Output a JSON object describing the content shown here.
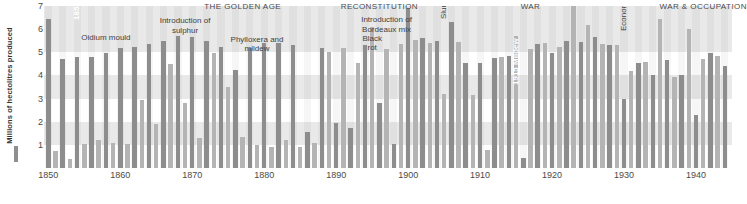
{
  "axes": {
    "y_title": "Millions of hectolitres produced",
    "y_ticks": [
      "1",
      "2",
      "3",
      "4",
      "5",
      "6",
      "7"
    ],
    "x_ticks": [
      "1850",
      "1860",
      "1870",
      "1880",
      "1890",
      "1900",
      "1910",
      "1920",
      "1930",
      "1940"
    ]
  },
  "eras": [
    {
      "label": "THE GOLDEN AGE",
      "year": 1877
    },
    {
      "label": "RECONSTITUTION",
      "year": 1896
    },
    {
      "label": "WAR",
      "year": 1917
    },
    {
      "label": "WAR & OCCUPATION",
      "year": 1941
    }
  ],
  "notes": [
    {
      "label": "Introduction of\nsulphur",
      "year": 1869,
      "value": 6.55
    },
    {
      "label": "Oidium mould",
      "year": 1858,
      "value": 5.85
    },
    {
      "label": "Phylloxera and\nmildew",
      "year": 1879,
      "value": 5.75
    },
    {
      "label": "Introduction of\nBordeaux mix",
      "year": 1897,
      "value": 6.6
    },
    {
      "label": "Black\nrot",
      "year": 1895,
      "value": 5.8
    }
  ],
  "vertical_notes": [
    {
      "label": "1855 Classification of the Médoc",
      "year": 1855,
      "value": 6.4,
      "style": "white"
    },
    {
      "label": "Slump",
      "year": 1906,
      "value": 6.45,
      "style": "dark"
    },
    {
      "label": "1915 Mildew",
      "year": 1916,
      "value": 3.6,
      "style": "white"
    },
    {
      "label": "Economic crisis",
      "year": 1931,
      "value": 5.9,
      "style": "dark"
    }
  ],
  "colors": {
    "bar_dark": "#8d8d8d",
    "bar_light": "#b4b4b4",
    "band": "#e9e9e9",
    "text": "#4a4a4a",
    "background": "#ffffff"
  },
  "chart_data": {
    "type": "bar",
    "title": "",
    "xlabel": "",
    "ylabel": "Millions of hectolitres produced",
    "xlim": [
      1849,
      1945
    ],
    "ylim": [
      0,
      7
    ],
    "grid": "horizontal-bands",
    "legend": "none",
    "x": [
      1850,
      1851,
      1852,
      1853,
      1854,
      1855,
      1856,
      1857,
      1858,
      1859,
      1860,
      1861,
      1862,
      1863,
      1864,
      1865,
      1866,
      1867,
      1868,
      1869,
      1870,
      1871,
      1872,
      1873,
      1874,
      1875,
      1876,
      1877,
      1878,
      1879,
      1880,
      1881,
      1882,
      1883,
      1884,
      1885,
      1886,
      1887,
      1888,
      1889,
      1890,
      1891,
      1892,
      1893,
      1894,
      1895,
      1896,
      1897,
      1898,
      1899,
      1900,
      1901,
      1902,
      1903,
      1904,
      1905,
      1906,
      1907,
      1908,
      1909,
      1910,
      1911,
      1912,
      1913,
      1914,
      1915,
      1916,
      1917,
      1918,
      1919,
      1920,
      1921,
      1922,
      1923,
      1924,
      1925,
      1926,
      1927,
      1928,
      1929,
      1930,
      1931,
      1932,
      1933,
      1934,
      1935,
      1936,
      1937,
      1938,
      1939,
      1940,
      1941,
      1942,
      1943,
      1944
    ],
    "values": [
      6.45,
      0.75,
      4.7,
      0.4,
      4.8,
      1.05,
      4.8,
      1.2,
      4.95,
      1.1,
      5.2,
      1.05,
      5.25,
      2.95,
      5.35,
      1.9,
      5.5,
      4.5,
      5.7,
      2.8,
      5.65,
      1.3,
      5.5,
      4.95,
      5.25,
      3.5,
      4.25,
      1.35,
      5.2,
      1.0,
      5.4,
      0.9,
      5.4,
      1.2,
      5.3,
      0.9,
      1.55,
      1.1,
      5.2,
      5.0,
      1.95,
      5.2,
      1.75,
      4.55,
      5.3,
      6.1,
      2.8,
      5.15,
      1.05,
      5.35,
      6.9,
      5.55,
      5.6,
      5.4,
      5.5,
      3.2,
      6.3,
      5.45,
      4.55,
      3.15,
      4.55,
      0.8,
      4.75,
      4.8,
      4.85,
      5.7,
      0.45,
      5.15,
      5.35,
      5.4,
      4.95,
      5.25,
      5.5,
      7.0,
      5.45,
      6.2,
      5.65,
      5.35,
      5.3,
      5.3,
      3.0,
      4.2,
      4.55,
      4.6,
      4.0,
      6.45,
      4.65,
      3.95,
      4.0,
      6.0,
      2.3,
      4.7,
      4.95,
      4.85,
      4.4
    ]
  }
}
